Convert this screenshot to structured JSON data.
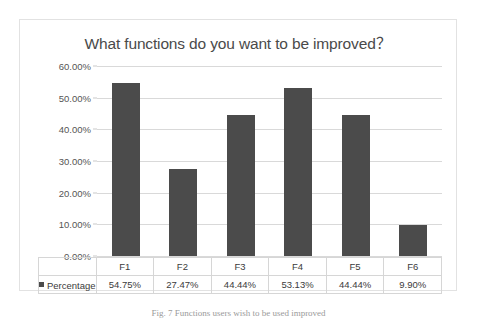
{
  "chart_data": {
    "type": "bar",
    "title": "What functions do you want to be improved？",
    "xlabel": "",
    "ylabel": "",
    "categories": [
      "F1",
      "F2",
      "F3",
      "F4",
      "F5",
      "F6"
    ],
    "series": [
      {
        "name": "Percentage",
        "values": [
          54.75,
          27.47,
          44.44,
          53.13,
          44.44,
          9.9
        ],
        "value_labels": [
          "54.75%",
          "27.47%",
          "44.44%",
          "53.13%",
          "44.44%",
          "9.90%"
        ],
        "color": "#4b4b4b"
      }
    ],
    "ylim": [
      0,
      60
    ],
    "ytick_labels": [
      "60.00%",
      "50.00%",
      "40.00%",
      "30.00%",
      "20.00%",
      "10.00%",
      "0.00%"
    ],
    "ytick_values": [
      60,
      50,
      40,
      30,
      20,
      10,
      0
    ],
    "grid": true,
    "legend_position": "data-table-left",
    "data_table_visible": true
  },
  "legend": {
    "marker_name": "legend-swatch",
    "label": "Percentage"
  },
  "caption": {
    "text": "Fig. 7  Functions users wish to be used improved"
  }
}
